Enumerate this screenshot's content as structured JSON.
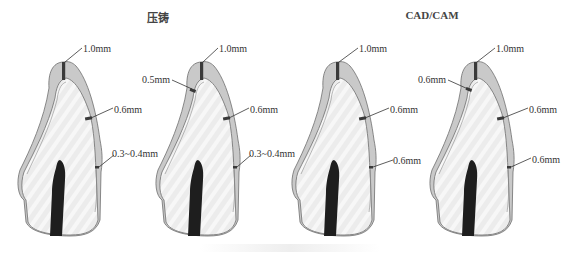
{
  "figure": {
    "groups": [
      {
        "title": "压铸",
        "center_x": 158
      },
      {
        "title": "CAD/CAM",
        "center_x": 432
      }
    ],
    "teeth": [
      {
        "group": "压铸",
        "offset_x": 0,
        "labels": [
          {
            "text": "1.0mm",
            "region": "incisal",
            "x": 83,
            "y": 43
          },
          {
            "text": "0.6mm",
            "region": "labial-middle",
            "x": 114,
            "y": 105
          },
          {
            "text": "0.3~0.4mm",
            "region": "labial-cervical",
            "x": 112,
            "y": 148
          }
        ]
      },
      {
        "group": "压铸",
        "offset_x": 138,
        "labels": [
          {
            "text": "0.5mm",
            "region": "lingual",
            "x": 143,
            "y": 75
          },
          {
            "text": "1.0mm",
            "region": "incisal",
            "x": 219,
            "y": 43
          },
          {
            "text": "0.6mm",
            "region": "labial-middle",
            "x": 250,
            "y": 105
          },
          {
            "text": "0.3~0.4mm",
            "region": "labial-cervical",
            "x": 249,
            "y": 148
          }
        ]
      },
      {
        "group": "CAD/CAM",
        "offset_x": 274,
        "labels": [
          {
            "text": "1.0mm",
            "region": "incisal",
            "x": 359,
            "y": 43
          },
          {
            "text": "0.6mm",
            "region": "labial-middle",
            "x": 390,
            "y": 105
          },
          {
            "text": "0.6mm",
            "region": "labial-cervical",
            "x": 393,
            "y": 155
          }
        ]
      },
      {
        "group": "CAD/CAM",
        "offset_x": 412,
        "labels": [
          {
            "text": "0.6mm",
            "region": "lingual",
            "x": 419,
            "y": 75
          },
          {
            "text": "1.0mm",
            "region": "incisal",
            "x": 496,
            "y": 43
          },
          {
            "text": "0.6mm",
            "region": "labial-middle",
            "x": 529,
            "y": 105
          },
          {
            "text": "0.6mm",
            "region": "labial-cervical",
            "x": 532,
            "y": 154
          }
        ]
      }
    ],
    "colors": {
      "veneer": "#c9c9c9",
      "core": "#e9e9e9",
      "outline": "#6e6e6e",
      "pulp": "#1e1e1e",
      "marker": "#3a3a3a",
      "leader": "#333333"
    }
  }
}
